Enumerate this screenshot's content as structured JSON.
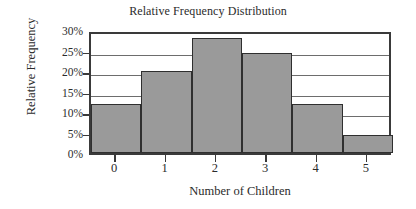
{
  "chart_data": {
    "type": "bar",
    "title": "Relative Frequency Distribution",
    "xlabel": "Number of Children",
    "ylabel": "Relative Frequency",
    "categories": [
      "0",
      "1",
      "2",
      "3",
      "4",
      "5"
    ],
    "values": [
      12,
      20,
      28,
      24.3,
      12,
      4.3
    ],
    "value_labels": [
      "12%",
      "20%",
      "28%",
      "24.3%",
      "12%",
      "4.3%"
    ],
    "ylim": [
      0,
      30
    ],
    "ytick_values": [
      0,
      5,
      10,
      15,
      20,
      25,
      30
    ],
    "ytick_labels": [
      "0%",
      "5%",
      "10%",
      "15%",
      "20%",
      "25%",
      "30%"
    ],
    "grid": true,
    "grid_axis": "y",
    "legend": null,
    "bar_fill_color": "#9a9a9a",
    "bar_edge_color": "#2f2f2f",
    "axis_color": "#3a3a3a",
    "grid_color": "#6d6d6d",
    "background_color": "#ffffff"
  }
}
